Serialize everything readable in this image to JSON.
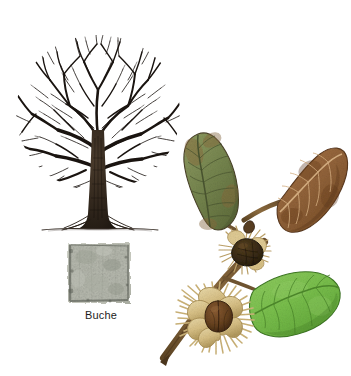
{
  "plate": {
    "title": "Buche",
    "common_name_de": "Buche",
    "background_color": "#ffffff",
    "width": 351,
    "height": 376
  },
  "figures": {
    "tree": {
      "name": "winter-silhouette",
      "label": "",
      "ink_color": "#1a1410",
      "trunk_color": "#2b2118",
      "ground_line_color": "#3a312a",
      "description": "leafless beech tree ink drawing"
    },
    "bark": {
      "name": "bark-swatch",
      "caption": "Buche",
      "base_color": "#b9bbb0",
      "light_color": "#d8dad1",
      "dark_color": "#6f736a",
      "edge_color": "#4e524a",
      "description": "smooth grey beech bark sample"
    },
    "branch": {
      "name": "fruiting-branch",
      "twig_color": "#7a5c36",
      "twig_shadow": "#4e3a22",
      "leaves": [
        {
          "id": "leaf-olive",
          "label": "olive leaf",
          "fill": "#7d8a56",
          "shade": "#5f6b3c",
          "blotch": "#8a6a3c",
          "vein": "#4a5530",
          "edge": "#4a4226"
        },
        {
          "id": "leaf-brown",
          "label": "autumn brown leaf",
          "fill": "#97663a",
          "shade": "#7a4e28",
          "blotch": "#6d421f",
          "vein": "#d8b183",
          "edge": "#5d3a1c"
        },
        {
          "id": "leaf-green",
          "label": "fresh green leaf",
          "fill": "#7cc04e",
          "shade": "#5da236",
          "blotch": "#8fce63",
          "vein": "#4e8a2c",
          "edge": "#3f7a22"
        }
      ],
      "fruits": [
        {
          "id": "cupule-open",
          "label": "open cupule with beechnut",
          "husk": "#e2cf9b",
          "husk_shade": "#c1a86c",
          "spine": "#d6bf86",
          "nut": "#6b4526",
          "nut_shade": "#4a2d15"
        },
        {
          "id": "cupule-closed",
          "label": "closed dark cupule",
          "husk": "#caa96f",
          "husk_shade": "#8a6a3c",
          "spine": "#e0cb94",
          "nut": "#3a2a18",
          "nut_shade": "#241a0f"
        }
      ]
    }
  }
}
